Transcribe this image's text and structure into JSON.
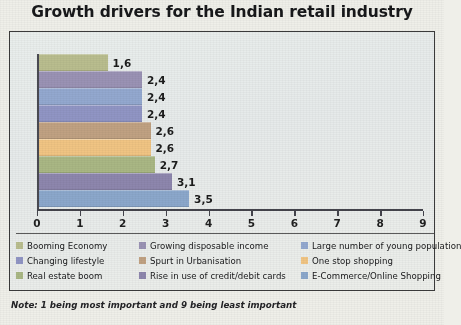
{
  "chart_data": {
    "type": "bar",
    "orientation": "horizontal",
    "title": "Growth drivers for the Indian retail industry",
    "xlabel": "",
    "ylabel": "",
    "xlim": [
      0,
      9
    ],
    "xticks": [
      "0",
      "1",
      "2",
      "3",
      "4",
      "5",
      "6",
      "7",
      "8",
      "9"
    ],
    "grid": false,
    "legend_position": "bottom",
    "note": "Note: 1 being most important and 9 being least important",
    "categories": [
      "Booming Economy",
      "Changing lifestyle",
      "Real estate boom",
      "Growing disposable income",
      "Spurt in Urbanisation",
      "Rise in use of credit/debit cards",
      "Large number of young population",
      "One stop shopping",
      "E-Commerce/Online Shopping"
    ],
    "bars": [
      {
        "label": "1,6",
        "value": 1.6,
        "color": "#b9bd8e"
      },
      {
        "label": "2,4",
        "value": 2.4,
        "color": "#9a92b4"
      },
      {
        "label": "2,4",
        "value": 2.4,
        "color": "#93a8cf"
      },
      {
        "label": "2,4",
        "value": 2.4,
        "color": "#9095c4"
      },
      {
        "label": "2,6",
        "value": 2.6,
        "color": "#c0a182"
      },
      {
        "label": "2,6",
        "value": 2.6,
        "color": "#f0c483"
      },
      {
        "label": "2,7",
        "value": 2.7,
        "color": "#a9b784"
      },
      {
        "label": "3,1",
        "value": 3.1,
        "color": "#8d86ad"
      },
      {
        "label": "3,5",
        "value": 3.5,
        "color": "#8ba7cb"
      }
    ],
    "legend": [
      {
        "label": "Booming Economy",
        "color": "#b9bd8e"
      },
      {
        "label": "Growing disposable income",
        "color": "#9a92b4"
      },
      {
        "label": "Large number of young population",
        "color": "#93a8cf"
      },
      {
        "label": "Changing lifestyle",
        "color": "#9095c4"
      },
      {
        "label": "Spurt in Urbanisation",
        "color": "#c0a182"
      },
      {
        "label": "One stop shopping",
        "color": "#f0c483"
      },
      {
        "label": "Real estate boom",
        "color": "#a9b784"
      },
      {
        "label": "Rise in use of credit/debit cards",
        "color": "#8d86ad"
      },
      {
        "label": "E-Commerce/Online Shopping",
        "color": "#8ba7cb"
      }
    ]
  }
}
